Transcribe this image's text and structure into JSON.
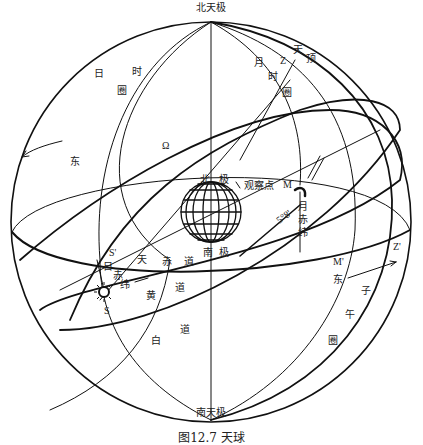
{
  "figure": {
    "caption": "图12.7 天球"
  },
  "colors": {
    "ink": "#111111",
    "background": "#ffffff"
  },
  "labels": {
    "north_celestial_pole": "北天极",
    "south_celestial_pole": "南天极",
    "sun_hour_circle": [
      "日",
      "时",
      "圈"
    ],
    "moon_hour_circle": [
      "月",
      "时",
      "圈"
    ],
    "zenith": [
      "天",
      "顶"
    ],
    "zenith_symbol": "Z",
    "ascending_node": "Ω",
    "east_left": "东",
    "earth_north_pole": [
      "北",
      "极"
    ],
    "earth_south_pole": [
      "南",
      "极"
    ],
    "observer": "观察点",
    "moon": "M",
    "moon_projection": "M'",
    "moon_declination": [
      "月",
      "赤",
      "纬"
    ],
    "moon_declination_angle": "5°8'",
    "zenith_projection": "Z'",
    "sun_projection": "S'",
    "sun": "S",
    "sun_declination": [
      "日",
      "赤",
      "纬"
    ],
    "celestial_equator": [
      "天",
      "赤",
      "道"
    ],
    "ecliptic": [
      "黄",
      "道"
    ],
    "lunar_path": [
      "白",
      "道"
    ],
    "east_right": "东",
    "meridian": [
      "子",
      "午",
      "圈"
    ]
  }
}
